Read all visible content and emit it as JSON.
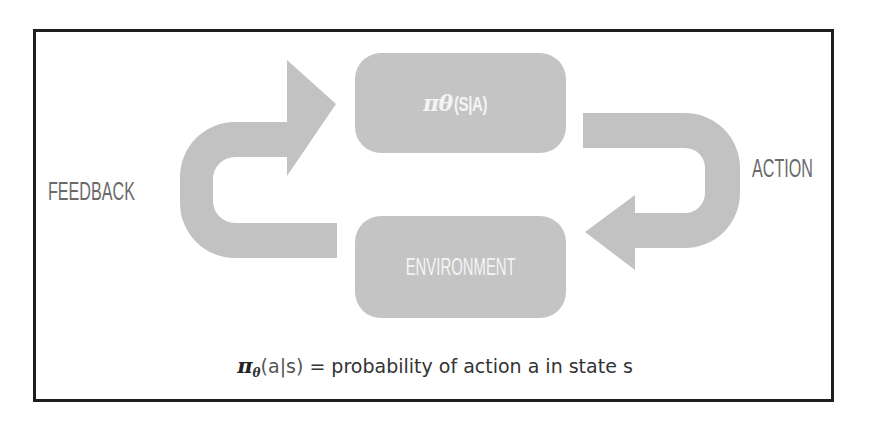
{
  "diagram": {
    "type": "reinforcement-learning-loop",
    "nodes": {
      "policy": {
        "pi": "π",
        "theta": "θ",
        "args": "(S|A)"
      },
      "environment": {
        "label": "ENVIRONMENT"
      }
    },
    "edges": {
      "feedback": {
        "label": "FEEDBACK",
        "from": "environment",
        "to": "policy"
      },
      "action": {
        "label": "ACTION",
        "from": "policy",
        "to": "environment"
      }
    },
    "caption": {
      "pi": "π",
      "subscript": "θ",
      "expr": "(a|s)",
      "text": " = probability of action a in state s"
    },
    "colors": {
      "box_fill": "#c4c4c4",
      "arrow_fill": "#c2c2c2",
      "box_text": "#f4f4f4",
      "side_label": "#6a6a6a",
      "frame_border": "#1e1e1e"
    }
  }
}
